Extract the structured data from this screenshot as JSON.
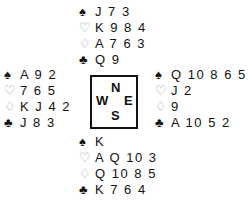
{
  "suits": {
    "spades": "♠",
    "hearts": "♡",
    "diamonds": "♢",
    "clubs": "♣"
  },
  "hands": {
    "north": {
      "spades": "J 7 3",
      "hearts": "K 9 8 4",
      "diamonds": "A 7 6 3",
      "clubs": "Q 9"
    },
    "west": {
      "spades": "A 9 2",
      "hearts": "7 6 5",
      "diamonds": "K J 4 2",
      "clubs": "J 8 3"
    },
    "east": {
      "spades": "Q 10 8 6 5 4",
      "hearts": "J 2",
      "diamonds": "9",
      "clubs": "A 10 5 2"
    },
    "south": {
      "spades": "K",
      "hearts": "A Q 10 3",
      "diamonds": "Q 10 8 5",
      "clubs": "K 7 6 4"
    }
  },
  "compass": {
    "n": "N",
    "w": "W",
    "e": "E",
    "s": "S"
  }
}
